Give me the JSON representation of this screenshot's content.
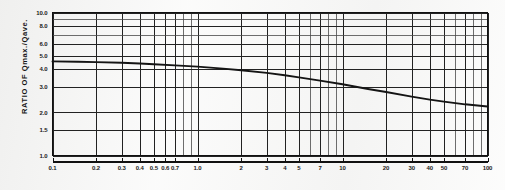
{
  "chart_data": {
    "type": "line",
    "title": "",
    "subtitle": "",
    "xlabel": "",
    "ylabel": "RATIO OF Qmax./Qave.",
    "xscale": "log",
    "yscale": "log",
    "xlim": [
      0.1,
      100
    ],
    "ylim": [
      1.0,
      10.0
    ],
    "grid": true,
    "legend": null,
    "x_tick_labels": [
      "0.1",
      "0.2",
      "0.3",
      "0.4",
      "0.5",
      "0.6",
      "0.7",
      "1.0",
      "2",
      "3",
      "4",
      "5",
      "7",
      "10",
      "20",
      "30",
      "40",
      "50",
      "70",
      "100"
    ],
    "x_tick_values": [
      0.1,
      0.2,
      0.3,
      0.4,
      0.5,
      0.6,
      0.7,
      1.0,
      2,
      3,
      4,
      5,
      7,
      10,
      20,
      30,
      40,
      50,
      70,
      100
    ],
    "y_tick_labels": [
      "1.0",
      "1.5",
      "2.0",
      "3.0",
      "4.0",
      "5.0",
      "6.0",
      "8.0",
      "10.0"
    ],
    "y_tick_values": [
      1.0,
      1.5,
      2.0,
      3.0,
      4.0,
      5.0,
      6.0,
      8.0,
      10.0
    ],
    "x_minor_gridlines": [
      0.1,
      0.2,
      0.3,
      0.4,
      0.5,
      0.6,
      0.7,
      0.8,
      0.9,
      1.0,
      2,
      3,
      4,
      5,
      6,
      7,
      8,
      9,
      10,
      20,
      30,
      40,
      50,
      60,
      70,
      80,
      90,
      100
    ],
    "y_minor_gridlines": [
      1.0,
      1.5,
      2.0,
      3.0,
      4.0,
      5.0,
      6.0,
      7.0,
      8.0,
      9.0,
      10.0
    ],
    "series": [
      {
        "name": "Qmax./Qave. ratio",
        "color": "#141414",
        "x": [
          0.1,
          0.15,
          0.2,
          0.3,
          0.4,
          0.5,
          0.7,
          1.0,
          1.5,
          2,
          3,
          4,
          5,
          7,
          10,
          15,
          20,
          30,
          40,
          50,
          70,
          100
        ],
        "y": [
          4.55,
          4.52,
          4.5,
          4.45,
          4.4,
          4.35,
          4.27,
          4.18,
          4.05,
          3.95,
          3.78,
          3.64,
          3.52,
          3.34,
          3.15,
          2.92,
          2.78,
          2.58,
          2.46,
          2.38,
          2.28,
          2.2
        ]
      }
    ]
  },
  "axes": {
    "y_title": "RATIO OF Qmax./Qave."
  }
}
